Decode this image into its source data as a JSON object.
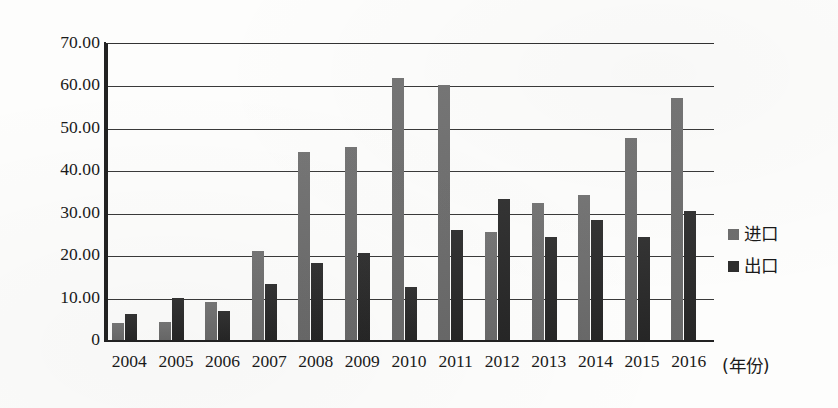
{
  "chart_data": {
    "type": "bar",
    "title": "",
    "xlabel": "(年份)",
    "ylabel": "",
    "categories": [
      "2004",
      "2005",
      "2006",
      "2007",
      "2008",
      "2009",
      "2010",
      "2011",
      "2012",
      "2013",
      "2014",
      "2015",
      "2016"
    ],
    "series": [
      {
        "name": "进口",
        "color": "#6e6e6e",
        "values": [
          4.0,
          4.3,
          9.0,
          21.0,
          44.2,
          45.6,
          61.8,
          60.0,
          25.4,
          32.3,
          34.2,
          47.7,
          57.0
        ]
      },
      {
        "name": "出口",
        "color": "#2e2e2e",
        "values": [
          6.1,
          10.0,
          6.8,
          13.3,
          18.2,
          20.4,
          12.4,
          26.0,
          33.2,
          24.2,
          28.2,
          24.3,
          30.5
        ]
      }
    ],
    "ylim": [
      0,
      70
    ],
    "yticks": [
      0,
      10,
      20,
      30,
      40,
      50,
      60,
      70
    ],
    "ytick_labels": [
      "0",
      "10.00",
      "20.00",
      "30.00",
      "40.00",
      "50.00",
      "60.00",
      "70.00"
    ],
    "grid": true,
    "grid_axis": "y",
    "legend_position": "right"
  },
  "legend": {
    "entries": [
      {
        "label": "进口",
        "color": "#6e6e6e"
      },
      {
        "label": "出口",
        "color": "#2e2e2e"
      }
    ]
  },
  "axis": {
    "x_title": "(年份)"
  }
}
